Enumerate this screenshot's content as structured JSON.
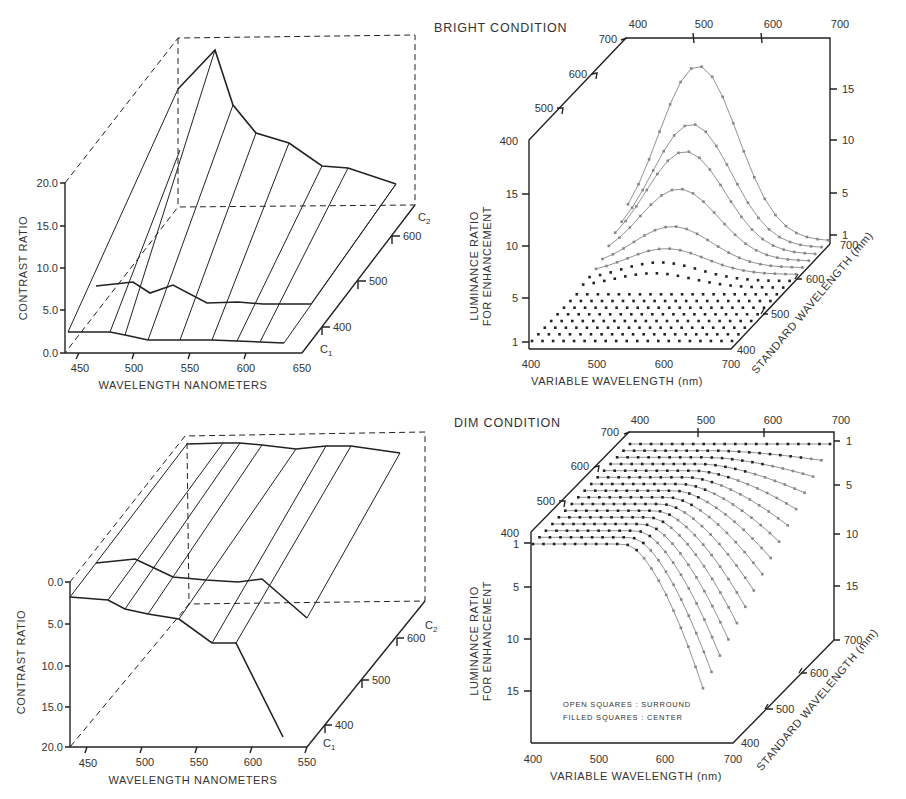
{
  "figure": {
    "panels": {
      "top_left": {
        "ylabel": "CONTRAST RATIO",
        "xlabel": "WAVELENGTH NANOMETERS",
        "yticks": [
          "20.0",
          "15.0",
          "10.0",
          "5.0",
          "0.0"
        ],
        "xticks": [
          "450",
          "500",
          "550",
          "600",
          "650"
        ],
        "depth_ticks": [
          "400",
          "500",
          "600"
        ],
        "depth_labels": {
          "front": "C",
          "front_sub": "1",
          "back": "C",
          "back_sub": "2"
        }
      },
      "top_right": {
        "title": "BRIGHT CONDITION",
        "ylabel_line1": "LUMINANCE RATIO",
        "ylabel_line2": "FOR ENHANCEMENT",
        "xlabel": "VARIABLE WAVELENGTH (nm)",
        "depth_label": "STANDARD WAVELENGTH (mm)",
        "left_yticks": [
          "15",
          "10",
          "5",
          "1"
        ],
        "right_yticks": [
          "15",
          "10",
          "5",
          "1"
        ],
        "xticks": [
          "400",
          "500",
          "600",
          "700"
        ],
        "top_xticks": [
          "400",
          "500",
          "600",
          "700"
        ],
        "left_depth_ticks": [
          "400",
          "500",
          "600",
          "700"
        ],
        "right_depth_ticks": [
          "400",
          "500",
          "600",
          "700"
        ]
      },
      "bottom_left": {
        "ylabel": "CONTRAST RATIO",
        "xlabel": "WAVELENGTH NANOMETERS",
        "yticks": [
          "0.0",
          "5.0",
          "10.0",
          "15.0",
          "20.0"
        ],
        "xticks": [
          "450",
          "500",
          "550",
          "600",
          "550"
        ],
        "depth_ticks": [
          "400",
          "500",
          "600"
        ],
        "depth_labels": {
          "front": "C",
          "front_sub": "1",
          "back": "C",
          "back_sub": "2"
        }
      },
      "bottom_right": {
        "title": "DIM CONDITION",
        "ylabel_line1": "LUMINANCE RATIO",
        "ylabel_line2": "FOR ENHANCEMENT",
        "xlabel": "VARIABLE WAVELENGTH (nm)",
        "depth_label": "STANDARD WAVELENGTH (mm)",
        "left_yticks": [
          "1",
          "5",
          "10",
          "15"
        ],
        "right_yticks": [
          "1",
          "5",
          "10",
          "15"
        ],
        "xticks": [
          "400",
          "500",
          "600",
          "700"
        ],
        "top_xticks": [
          "400",
          "500",
          "600",
          "700"
        ],
        "left_depth_ticks": [
          "400",
          "500",
          "600",
          "700"
        ],
        "right_depth_ticks": [
          "400",
          "500",
          "600",
          "700"
        ],
        "legend_line1": "OPEN SQUARES : SURROUND",
        "legend_line2": "FILLED SQUARES : CENTER"
      }
    }
  },
  "chart_data": [
    {
      "type": "surface-3d",
      "panel": "top_left",
      "title": "",
      "xlabel": "WAVELENGTH NANOMETERS",
      "ylabel": "CONTRAST RATIO",
      "zlabel": "C1 to C2 (400-600)",
      "ylim": [
        0,
        20
      ],
      "xlim": [
        440,
        650
      ],
      "series": [
        {
          "name": "C1 (front)",
          "x": [
            440,
            480,
            495,
            515,
            545,
            575,
            600,
            635
          ],
          "values": [
            2.4,
            2.5,
            2.2,
            1.5,
            1.5,
            1.5,
            1.5,
            1.3
          ]
        },
        {
          "name": "mid",
          "x": [
            465,
            500,
            515,
            535,
            565,
            590,
            615,
            650
          ],
          "values": [
            7.5,
            8.0,
            6.0,
            7.2,
            4.0,
            4.2,
            3.6,
            3.6
          ]
        },
        {
          "name": "C2 (back)",
          "x": [
            440,
            475,
            495,
            515,
            545,
            575,
            600,
            645
          ],
          "values": [
            15.0,
            20.0,
            13.0,
            9.0,
            7.5,
            4.0,
            4.0,
            1.2
          ]
        }
      ]
    },
    {
      "type": "surface-3d-scatter",
      "panel": "top_right",
      "title": "BRIGHT CONDITION",
      "xlabel": "VARIABLE WAVELENGTH (nm)",
      "ylabel": "LUMINANCE RATIO FOR ENHANCEMENT",
      "zlabel": "STANDARD WAVELENGTH (mm)",
      "xlim": [
        400,
        700
      ],
      "ylim": [
        1,
        18
      ],
      "zlim": [
        400,
        700
      ],
      "series": [
        {
          "name": "std 700",
          "peak_x": 600,
          "peak": 17.0
        },
        {
          "name": "std 680",
          "peak_x": 590,
          "peak": 12.0
        },
        {
          "name": "std 660",
          "peak_x": 585,
          "peak": 10.0
        },
        {
          "name": "std 640",
          "peak_x": 580,
          "peak": 7.0
        },
        {
          "name": "std 620",
          "peak_x": 575,
          "peak": 4.0
        },
        {
          "name": "std 600",
          "peak_x": 570,
          "peak": 2.5
        },
        {
          "name": "std 580",
          "peak_x": 565,
          "peak": 1.8
        },
        {
          "name": "std 560",
          "peak_x": 560,
          "peak": 1.4
        }
      ]
    },
    {
      "type": "surface-3d",
      "panel": "bottom_left",
      "xlabel": "WAVELENGTH NANOMETERS",
      "ylabel": "CONTRAST RATIO",
      "ylim": [
        20,
        0
      ],
      "series": [
        {
          "name": "C1 (front)",
          "x": [
            440,
            470,
            490,
            510,
            535,
            560,
            585,
            625
          ],
          "values": [
            1.8,
            2.2,
            3.4,
            4.1,
            4.7,
            7.5,
            7.5,
            19.0
          ]
        },
        {
          "name": "mid",
          "x": [
            465,
            495,
            515,
            535,
            565,
            590,
            615,
            650
          ],
          "values": [
            -1.7,
            -2.3,
            -0.4,
            1.2,
            1.6,
            1.8,
            1.4,
            4.5
          ]
        },
        {
          "name": "C2 (back)",
          "x": [
            440,
            475,
            495,
            515,
            545,
            575,
            600,
            645
          ],
          "values": [
            0,
            0,
            0,
            0,
            0.3,
            0.2,
            0.2,
            0.8
          ]
        }
      ]
    },
    {
      "type": "surface-3d-scatter",
      "panel": "bottom_right",
      "title": "DIM CONDITION",
      "xlabel": "VARIABLE WAVELENGTH (nm)",
      "ylabel": "LUMINANCE RATIO FOR ENHANCEMENT",
      "zlabel": "STANDARD WAVELENGTH (mm)",
      "xlim": [
        400,
        700
      ],
      "ylim": [
        1,
        18
      ],
      "zlim": [
        400,
        700
      ],
      "legend": [
        "OPEN SQUARES : SURROUND",
        "FILLED SQUARES : CENTER"
      ],
      "series": [
        {
          "name": "std 400",
          "end_x": 700,
          "end_value": 13.0
        },
        {
          "name": "std 500",
          "end_x": 700,
          "end_value": 11.0
        },
        {
          "name": "std 600",
          "end_x": 700,
          "end_value": 6.0
        },
        {
          "name": "std 700",
          "end_x": 700,
          "end_value": 2.0
        }
      ]
    }
  ]
}
